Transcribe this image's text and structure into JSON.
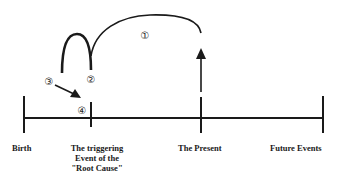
{
  "timeline": {
    "events": [
      {
        "label": "Birth",
        "x": 24
      },
      {
        "label_lines": [
          "The triggering",
          "Event of the",
          "\"Root Cause\""
        ],
        "x": 91
      },
      {
        "label": "The Present",
        "x": 201
      },
      {
        "label": "Future Events",
        "x": 323
      }
    ]
  },
  "markers": {
    "m1": "①",
    "m2": "②",
    "m3": "③",
    "m4": "④"
  },
  "colors": {
    "ink": "#1a1a1a",
    "background": "#ffffff"
  }
}
